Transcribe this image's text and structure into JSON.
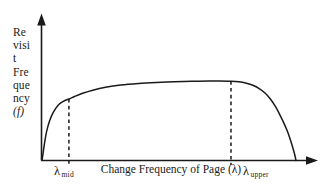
{
  "figure": {
    "name": "revisit-frequency-vs-change-frequency",
    "background_color": "#ffffff",
    "ink_color": "#1a1a1a"
  },
  "axes": {
    "y_label_lines": [
      "Re",
      "visi",
      "t",
      "Fre",
      "que",
      "ncy",
      "(f)"
    ],
    "y_label_full": "Revisit Frequency (f)",
    "x_title": "Change Frequency of Page (λ)",
    "x_tick_labels": [
      {
        "symbol": "λ",
        "subscript": "mid"
      },
      {
        "symbol": "λ",
        "subscript": "upper"
      }
    ]
  },
  "chart_data": {
    "type": "line",
    "title": "",
    "subtitle": "",
    "xlabel": "Change Frequency of Page (λ)",
    "ylabel": "Revisit Frequency (f)",
    "xlim": [
      0,
      1
    ],
    "ylim": [
      0,
      1
    ],
    "grid": false,
    "legend": false,
    "legend_position": "none",
    "axis_style": "arrow-headed open axes, no numeric ticks",
    "annotations": [
      {
        "name": "lambda-mid-guide",
        "label": "λ mid",
        "type": "vertical-dashed-line",
        "x": 0.106,
        "y_top": 0.494
      },
      {
        "name": "lambda-upper-guide",
        "label": "λ upper",
        "type": "vertical-dashed-line",
        "x": 0.744,
        "y_top": 0.637
      }
    ],
    "series": [
      {
        "name": "revisit frequency curve",
        "color": "#1a1a1a",
        "x": [
          0.0,
          0.004,
          0.01,
          0.018,
          0.03,
          0.046,
          0.066,
          0.088,
          0.106,
          0.13,
          0.16,
          0.2,
          0.25,
          0.31,
          0.38,
          0.45,
          0.52,
          0.59,
          0.66,
          0.7,
          0.744,
          0.775,
          0.805,
          0.83,
          0.855,
          0.878,
          0.9,
          0.92,
          0.94,
          0.955,
          0.968,
          0.98,
          0.99,
          0.996,
          1.0
        ],
        "y": [
          0.0,
          0.055,
          0.14,
          0.232,
          0.32,
          0.392,
          0.45,
          0.48,
          0.494,
          0.516,
          0.54,
          0.565,
          0.588,
          0.606,
          0.618,
          0.626,
          0.632,
          0.636,
          0.639,
          0.639,
          0.637,
          0.632,
          0.62,
          0.604,
          0.578,
          0.542,
          0.492,
          0.43,
          0.352,
          0.288,
          0.224,
          0.152,
          0.084,
          0.038,
          0.0
        ]
      }
    ]
  }
}
